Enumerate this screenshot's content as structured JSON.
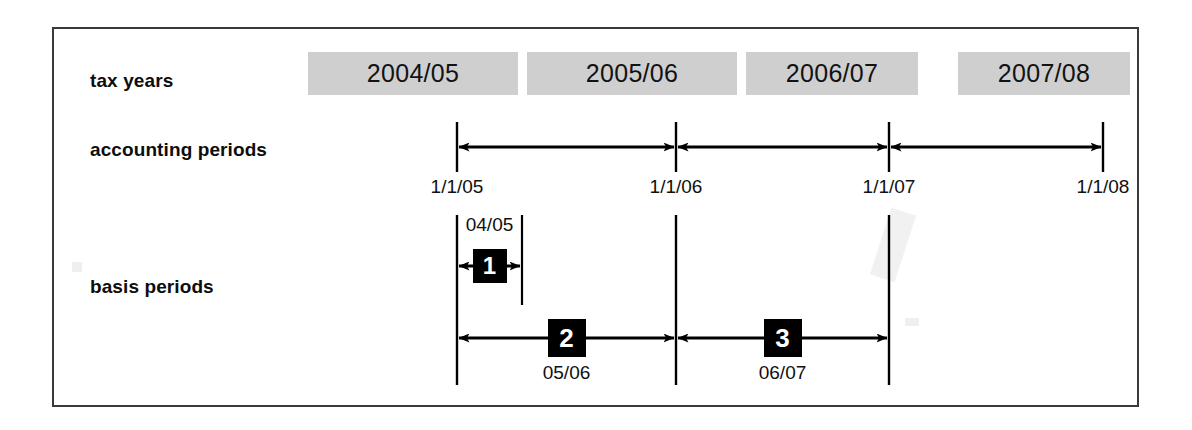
{
  "diagram": {
    "frame_color": "#3a3a3a",
    "bar_fill": "#cfcfcf",
    "badge_fill": "#000000",
    "rows": {
      "tax_years_label": "tax years",
      "accounting_periods_label": "accounting periods",
      "basis_periods_label": "basis periods"
    },
    "tax_years": [
      {
        "label": "2004/05",
        "left": 308,
        "width": 210
      },
      {
        "label": "2005/06",
        "left": 527,
        "width": 210
      },
      {
        "label": "2006/07",
        "left": 746,
        "width": 172
      },
      {
        "label": "2007/08",
        "left": 958,
        "width": 172
      }
    ],
    "accounting_periods": {
      "ticks": [
        {
          "label": "1/1/05",
          "x": 457
        },
        {
          "label": "1/1/06",
          "x": 676
        },
        {
          "label": "1/1/07",
          "x": 889
        },
        {
          "label": "1/1/08",
          "x": 1103
        }
      ],
      "arrows": [
        {
          "from": 457,
          "to": 676
        },
        {
          "from": 676,
          "to": 889
        },
        {
          "from": 889,
          "to": 1103
        }
      ]
    },
    "basis_periods": [
      {
        "number": "1",
        "caption": "04/05",
        "caption_position": "above",
        "from": 457,
        "to": 522,
        "y": 266
      },
      {
        "number": "2",
        "caption": "05/06",
        "caption_position": "below",
        "from": 457,
        "to": 676,
        "y": 338
      },
      {
        "number": "3",
        "caption": "06/07",
        "caption_position": "below",
        "from": 676,
        "to": 889,
        "y": 338
      }
    ]
  }
}
